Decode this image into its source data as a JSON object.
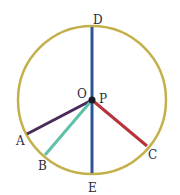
{
  "diagram": {
    "type": "circle-with-radii",
    "circle": {
      "cx": 92,
      "cy": 100,
      "r": 74,
      "color": "#c4b04a"
    },
    "center_point": {
      "x": 92,
      "y": 100,
      "color": "#1a1a2a"
    },
    "labels": {
      "D": "D",
      "E": "E",
      "O": "O",
      "P": "P",
      "A": "A",
      "B": "B",
      "C": "C"
    },
    "segments": [
      {
        "name": "DE",
        "from": "D",
        "to": "E",
        "color": "#2f5597"
      },
      {
        "name": "PA",
        "from": "P",
        "to": "A",
        "color": "#4b2a5c"
      },
      {
        "name": "PB",
        "from": "P",
        "to": "B",
        "color": "#5fc0a8"
      },
      {
        "name": "PC",
        "from": "P",
        "to": "C",
        "color": "#b8343c"
      }
    ]
  }
}
